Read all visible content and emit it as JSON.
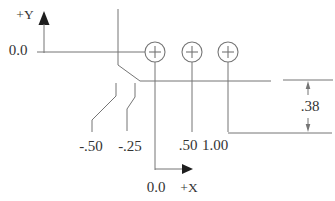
{
  "diagram": {
    "title_hint": "part coordinate setup drawing",
    "y_axis_label": "+Y",
    "x_axis_label": "+X",
    "y_origin_label": "0.0",
    "x_origin_label": "0.0",
    "negative_x_labels": [
      "-.50",
      "-.25"
    ],
    "positive_x_labels": [
      ".50",
      "1.00"
    ],
    "depth_dimension": ".38",
    "hole_symbols": [
      {
        "x_value": "0.0"
      },
      {
        "x_value": ".50"
      },
      {
        "x_value": "1.00"
      }
    ],
    "colors": {
      "line": "#757575",
      "text": "#333333",
      "arrow": "#1e1e1e",
      "bg": "#ffffff"
    }
  }
}
